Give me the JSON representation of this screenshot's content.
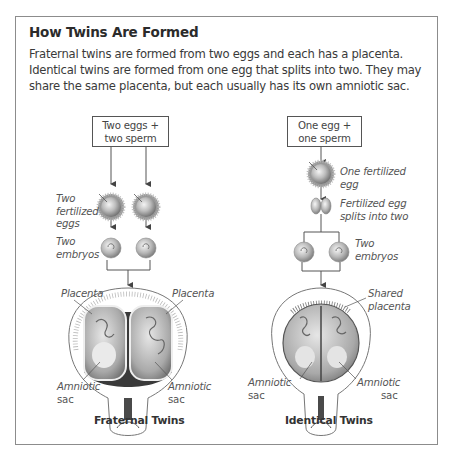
{
  "title": "How Twins Are Formed",
  "intro": {
    "line1": "Fraternal twins are formed from two eggs and each has a placenta.",
    "line2": "Identical twins are formed from one egg that splits into two. They may",
    "line3": "share the same placenta, but each usually has its own amniotic sac."
  },
  "fraternal": {
    "box_line1": "Two eggs  +",
    "box_line2": "two sperm",
    "fertilized_label": [
      "Two",
      "fertilized",
      "eggs"
    ],
    "embryos_label": [
      "Two",
      "embryos"
    ],
    "placenta_left": "Placenta",
    "placenta_right": "Placenta",
    "amniotic_left": [
      "Amniotic",
      "sac"
    ],
    "amniotic_right": [
      "Amniotic",
      "sac"
    ],
    "caption": "Fraternal Twins"
  },
  "identical": {
    "box_line1": "One egg  +",
    "box_line2": "one sperm",
    "fertilized_label": [
      "One fertilized",
      "egg"
    ],
    "split_label": [
      "Fertilized egg",
      "splits into two"
    ],
    "embryos_label": [
      "Two",
      "embryos"
    ],
    "shared_placenta": [
      "Shared",
      "placenta"
    ],
    "amniotic_left": [
      "Amniotic",
      "sac"
    ],
    "amniotic_right": [
      "Amniotic",
      "sac"
    ],
    "caption": "Identical Twins"
  },
  "colors": {
    "frame": "#8c8c8c",
    "text": "#333333",
    "line": "#555555"
  }
}
